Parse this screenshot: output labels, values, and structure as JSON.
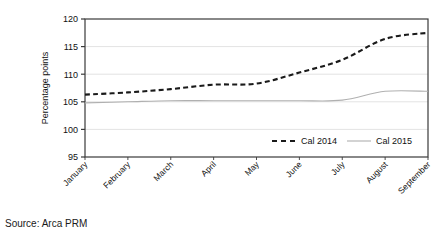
{
  "source_note": "Source: Arca PRM",
  "chart_data": {
    "type": "line",
    "title": "",
    "xlabel": "",
    "ylabel": "Percentage points",
    "ylim": [
      95,
      120
    ],
    "yticks": [
      95,
      100,
      105,
      110,
      115,
      120
    ],
    "ytick_labels": [
      "95",
      "100",
      "105",
      "110",
      "115",
      "120"
    ],
    "grid": true,
    "grid_axis": "y",
    "legend_position": "inside-bottom-right",
    "categories": [
      "January",
      "February",
      "March",
      "April",
      "May",
      "June",
      "July",
      "August",
      "September"
    ],
    "series": [
      {
        "name": "Cal 2014",
        "style": "dashed",
        "color": "#1a1a1a",
        "values": [
          106.3,
          106.7,
          107.3,
          108.1,
          108.3,
          110.3,
          112.6,
          116.4,
          117.5
        ]
      },
      {
        "name": "Cal 2015",
        "style": "solid",
        "color": "#b0b0b0",
        "values": [
          104.8,
          105.0,
          105.2,
          105.2,
          105.2,
          105.2,
          105.3,
          106.9,
          106.9
        ]
      }
    ]
  },
  "legend": {
    "items": [
      {
        "label": "Cal 2014"
      },
      {
        "label": "Cal 2015"
      }
    ]
  }
}
